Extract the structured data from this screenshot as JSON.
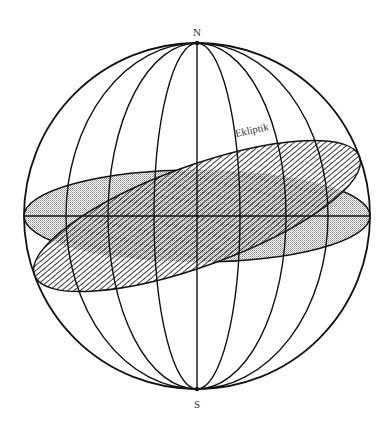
{
  "diagram": {
    "labels": {
      "north": "N",
      "south": "S",
      "ecliptic": "Ekliptik"
    },
    "colors": {
      "line": "#111111",
      "stipple": "#9a9a9a",
      "hatch": "#222222",
      "label": "#333333",
      "background": "#ffffff"
    },
    "sphere": {
      "cx": 197,
      "cy": 216,
      "r": 173
    },
    "meridians_rx": [
      43,
      89,
      131
    ],
    "equator": {
      "rx": 173,
      "ry": 46,
      "fill": "stipple"
    },
    "ecliptic": {
      "rx": 173,
      "ry": 50,
      "rotation_deg": -20,
      "fill": "hatch"
    }
  }
}
